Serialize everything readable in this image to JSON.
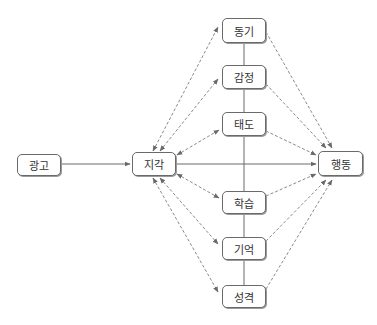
{
  "diagram": {
    "nodes": {
      "ad": {
        "label": "광고"
      },
      "perception": {
        "label": "지각"
      },
      "motivation": {
        "label": "동기"
      },
      "emotion": {
        "label": "감정"
      },
      "attitude": {
        "label": "태도"
      },
      "behavior": {
        "label": "행동"
      },
      "learning": {
        "label": "학습"
      },
      "memory": {
        "label": "기억"
      },
      "personality": {
        "label": "성격"
      }
    },
    "edges": [
      {
        "from": "광고",
        "to": "지각",
        "style": "solid",
        "direction": "forward"
      },
      {
        "from": "지각",
        "to": "행동",
        "style": "solid",
        "direction": "forward"
      },
      {
        "from": "지각",
        "to": "동기",
        "style": "dashed",
        "direction": "both"
      },
      {
        "from": "지각",
        "to": "감정",
        "style": "dashed",
        "direction": "both"
      },
      {
        "from": "지각",
        "to": "태도",
        "style": "dashed",
        "direction": "both"
      },
      {
        "from": "지각",
        "to": "학습",
        "style": "dashed",
        "direction": "both"
      },
      {
        "from": "지각",
        "to": "기억",
        "style": "dashed",
        "direction": "both"
      },
      {
        "from": "지각",
        "to": "성격",
        "style": "dashed",
        "direction": "both"
      },
      {
        "from": "동기",
        "to": "행동",
        "style": "dashed",
        "direction": "forward"
      },
      {
        "from": "감정",
        "to": "행동",
        "style": "dashed",
        "direction": "forward"
      },
      {
        "from": "태도",
        "to": "행동",
        "style": "dashed",
        "direction": "forward"
      },
      {
        "from": "학습",
        "to": "행동",
        "style": "dashed",
        "direction": "forward"
      },
      {
        "from": "기억",
        "to": "행동",
        "style": "dashed",
        "direction": "forward"
      },
      {
        "from": "성격",
        "to": "행동",
        "style": "dashed",
        "direction": "forward"
      },
      {
        "from": "동기",
        "to": "성격",
        "style": "solid",
        "direction": "none",
        "note": "vertical connector through middle column"
      }
    ],
    "caption": "",
    "colors": {
      "line": "#6a6a6a",
      "dashed": "#8a8a8a",
      "border": "#6a6a6a"
    }
  }
}
